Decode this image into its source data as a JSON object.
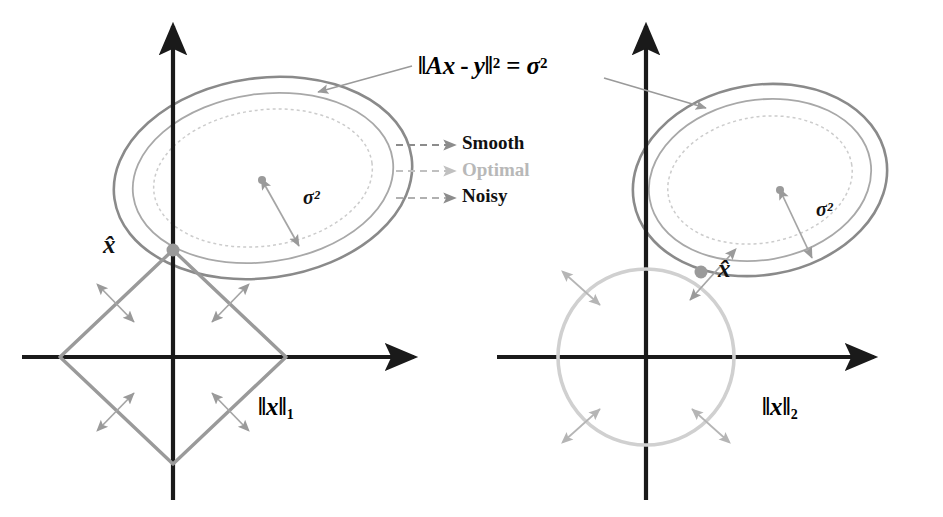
{
  "figure": {
    "title": "",
    "background_color": "#ffffff",
    "width": 943,
    "height": 517
  },
  "colors": {
    "axis": "#1a1a1a",
    "smooth_contour": "#8a8a8a",
    "optimal_contour": "#a8a8a8",
    "noisy_contour": "#cccccc",
    "l1_ball": "#9a9a9a",
    "l2_ball": "#d0d0d0",
    "arrow_gray": "#9a9a9a",
    "text_dark": "#111111",
    "text_gray": "#b0b0b0",
    "marker": "#9a9a9a"
  },
  "equation": {
    "label": "‖Ax - y‖² = σ²",
    "parts": {
      "bar": "‖",
      "A": "A",
      "x": "x",
      "minus": "-",
      "y": "y",
      "exponent": "2",
      "equals": "=",
      "sigma": "σ",
      "sigma_exponent": "2"
    }
  },
  "legend": {
    "position": "center",
    "items": [
      {
        "label": "Smooth",
        "color": "#111111",
        "style": "dashed-arrow"
      },
      {
        "label": "Optimal",
        "color": "#b8b8b8",
        "style": "dashed-arrow"
      },
      {
        "label": "Noisy",
        "color": "#111111",
        "style": "dashed-arrow"
      }
    ]
  },
  "panels": [
    {
      "id": "l1-panel",
      "name": "L1 regularization panel",
      "norm_label": "‖x‖",
      "norm_subscript": "1",
      "solution_label": "x̂",
      "sigma_label": "σ²",
      "ball": {
        "type": "diamond",
        "center": [
          173,
          357
        ],
        "radius_x": 113,
        "radius_y": 113,
        "vertices": [
          [
            173,
            250
          ],
          [
            286,
            357
          ],
          [
            173,
            464
          ],
          [
            60,
            357
          ]
        ]
      },
      "axes": {
        "origin": [
          173,
          357
        ],
        "x_from": [
          22,
          357
        ],
        "x_to": [
          420,
          357
        ],
        "y_from": [
          173,
          500
        ],
        "y_to": [
          173,
          18
        ]
      },
      "contour_center": [
        263,
        178
      ],
      "contour_rotation_deg": -8,
      "contours": [
        {
          "name": "Smooth",
          "rx": 150,
          "ry": 100,
          "color": "#8a8a8a",
          "width": 2.6,
          "dash": "none"
        },
        {
          "name": "Optimal",
          "rx": 131,
          "ry": 84,
          "color": "#a8a8a8",
          "width": 1.8,
          "dash": "none"
        },
        {
          "name": "Noisy",
          "rx": 110,
          "ry": 68,
          "color": "#cccccc",
          "width": 1.5,
          "dash": "3 3"
        }
      ],
      "solution_point": [
        173,
        250
      ],
      "center_dot": [
        262,
        180
      ],
      "sigma_arrow": {
        "from": [
          262,
          180
        ],
        "to": [
          299,
          246
        ]
      },
      "norm_label_pos": [
        262,
        420
      ],
      "solution_label_pos": [
        110,
        248
      ],
      "sigma_label_pos": [
        300,
        200
      ]
    },
    {
      "id": "l2-panel",
      "name": "L2 regularization panel",
      "norm_label": "‖x‖",
      "norm_subscript": "2",
      "solution_label": "x̂",
      "sigma_label": "σ²",
      "ball": {
        "type": "circle",
        "center": [
          646,
          357
        ],
        "radius": 88
      },
      "axes": {
        "origin": [
          646,
          357
        ],
        "x_from": [
          497,
          357
        ],
        "x_to": [
          880,
          357
        ],
        "y_from": [
          646,
          500
        ],
        "y_to": [
          646,
          18
        ]
      },
      "contour_center": [
        760,
        180
      ],
      "contour_rotation_deg": -10,
      "contours": [
        {
          "name": "Smooth",
          "rx": 128,
          "ry": 95,
          "color": "#8a8a8a",
          "width": 2.6,
          "dash": "none"
        },
        {
          "name": "Optimal",
          "rx": 112,
          "ry": 80,
          "color": "#a8a8a8",
          "width": 1.8,
          "dash": "none"
        },
        {
          "name": "Noisy",
          "rx": 93,
          "ry": 63,
          "color": "#cccccc",
          "width": 1.5,
          "dash": "3 3"
        }
      ],
      "solution_point": [
        701,
        272
      ],
      "center_dot": [
        780,
        190
      ],
      "sigma_arrow": {
        "from": [
          780,
          190
        ],
        "to": [
          812,
          258
        ]
      },
      "norm_label_pos": [
        765,
        420
      ],
      "solution_label_pos": [
        730,
        272
      ],
      "sigma_label_pos": [
        813,
        212
      ]
    }
  ],
  "annotations": {
    "equation_pos": [
      420,
      72
    ],
    "pointer_left": {
      "from": [
        412,
        66
      ],
      "to": [
        318,
        92
      ]
    },
    "pointer_right": {
      "from": [
        600,
        78
      ],
      "to": [
        704,
        105
      ]
    }
  },
  "gradient_arrows_note": "double-headed gray arrows normal to each ball boundary"
}
